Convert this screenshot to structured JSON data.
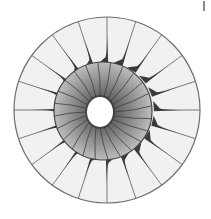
{
  "figure": {
    "width": 211,
    "height": 219,
    "background": "#ffffff",
    "outer_ring": {
      "cx": 107,
      "cy": 110,
      "r": 93,
      "fill": "#f1f1f1",
      "stroke": "#6e6e6e",
      "stroke_width": 1.2,
      "radial_line_count": 20,
      "radial_line_start_deg": 90
    },
    "blades": {
      "count": 20,
      "color": "#3a3a3a",
      "base_radius": 49,
      "tip_radius": 76,
      "base_half_width_deg": 5,
      "flare_direction": "counterclockwise",
      "start_deg": 90
    },
    "inner_disc": {
      "cx": 103,
      "cy": 111,
      "r": 49,
      "gradient_inner": "#5e5e5e",
      "gradient_outer": "#bdbdbd",
      "stroke": "#444444",
      "segment_count": 24,
      "segment_color": "#3d3d3d",
      "segment_curve_deg": 6
    },
    "hub_hole": {
      "cx": 100,
      "cy": 112,
      "rx": 13,
      "ry": 15,
      "fill": "#ffffff",
      "rim_color": "#2a2a2a"
    },
    "corner_mark": {
      "color": "#8a8a8a"
    }
  }
}
